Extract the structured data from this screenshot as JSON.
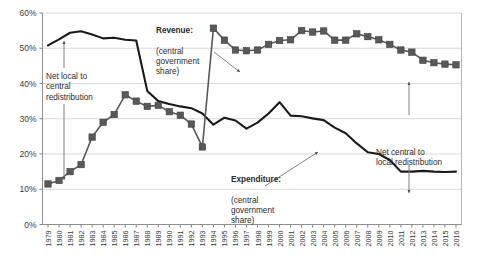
{
  "chart_data": {
    "type": "line",
    "title": "",
    "xlabel": "",
    "ylabel": "",
    "ylim": [
      0,
      60
    ],
    "ytick_labels": [
      "0%",
      "10%",
      "20%",
      "30%",
      "40%",
      "50%",
      "60%"
    ],
    "ytick_values": [
      0,
      10,
      20,
      30,
      40,
      50,
      60
    ],
    "grid": true,
    "legend_position": "inline-annotations",
    "categories": [
      "1979",
      "1980",
      "1981",
      "1982",
      "1983",
      "1984",
      "1985",
      "1986",
      "1987",
      "1988",
      "1989",
      "1990",
      "1991",
      "1992",
      "1993",
      "1994",
      "1995",
      "1996",
      "1997",
      "1998",
      "1999",
      "2000",
      "2001",
      "2002",
      "2003",
      "2004",
      "2005",
      "2006",
      "2007",
      "2008",
      "2009",
      "2010",
      "2011",
      "2012",
      "2013",
      "2014",
      "2015",
      "2016"
    ],
    "series": [
      {
        "name": "Revenue: (central government share)",
        "marker": "square",
        "color": "#595959",
        "values": [
          11.5,
          12.5,
          15.0,
          17.0,
          24.8,
          29.0,
          31.2,
          36.8,
          35.0,
          33.5,
          33.8,
          32.0,
          31.0,
          28.5,
          22.0,
          55.7,
          52.3,
          49.5,
          49.3,
          49.5,
          51.1,
          52.2,
          52.4,
          55.0,
          54.6,
          54.9,
          52.3,
          52.3,
          54.1,
          53.3,
          52.4,
          51.1,
          49.5,
          48.9,
          46.6,
          45.9,
          45.5,
          45.3
        ],
        "annotation": {
          "label": "Revenue:\n(central\ngovernment\nshare)"
        }
      },
      {
        "name": "Expenditure: (central government share)",
        "marker": "none",
        "color": "#1a1a1a",
        "values": [
          50.8,
          52.5,
          54.4,
          54.8,
          53.9,
          52.8,
          53.0,
          52.4,
          52.2,
          37.9,
          35.0,
          34.2,
          33.5,
          33.0,
          31.5,
          28.3,
          30.3,
          29.5,
          27.2,
          28.9,
          31.5,
          34.7,
          30.9,
          30.7,
          30.1,
          29.6,
          27.5,
          25.9,
          23.0,
          20.5,
          20.0,
          18.3,
          15.0,
          15.0,
          15.2,
          15.0,
          14.9,
          15.0
        ],
        "annotation": {
          "label": "Expenditure:\n(central\ngovernment\nshare)"
        }
      }
    ],
    "annotations": [
      {
        "name": "net-local-to-central",
        "text": "Net local to\ncentral\nredistribution"
      },
      {
        "name": "net-central-to-local",
        "text": "Net central to\nlocal redistribution"
      }
    ]
  },
  "labels": {
    "revenue_title": "Revenue:",
    "revenue_sub": "(central\ngovernment\nshare)",
    "expenditure_title": "Expenditure:",
    "expenditure_sub": "(central\ngovernment\nshare)",
    "net_local_central": "Net local to\ncentral\nredistribution",
    "net_central_local": "Net central to\nlocal redistribution"
  },
  "colors": {
    "revenue": "#595959",
    "expenditure": "#1a1a1a",
    "grid": "#d9d9d9",
    "axis": "#808080",
    "text": "#2b2b2b"
  }
}
